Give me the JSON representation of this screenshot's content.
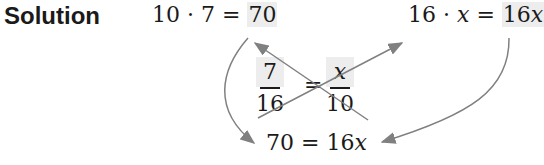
{
  "label": "Solution",
  "eq1": {
    "lhs": "10 · 7 = ",
    "rhs": "70"
  },
  "eq2": {
    "lhs_a": "16 · ",
    "lhs_var": "x",
    "eq": " = ",
    "rhs_coef": "16",
    "rhs_var": "x"
  },
  "proportion": {
    "left": {
      "numerator": "7",
      "denominator": "16"
    },
    "equals": "=",
    "right": {
      "numerator": "x",
      "denominator": "10"
    }
  },
  "result": {
    "lhs": "70 = 16",
    "var": "x"
  },
  "colors": {
    "arrow": "#808080",
    "highlight": "#ededed",
    "text": "#1a1a1a"
  }
}
